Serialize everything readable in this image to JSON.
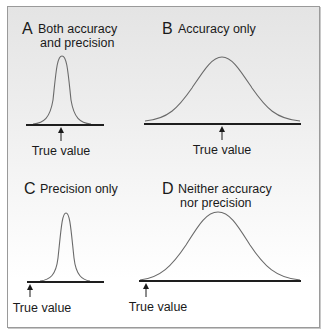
{
  "figure": {
    "panels": [
      {
        "letter": "A",
        "title_line1": "Both accuracy",
        "title_line2": "and precision",
        "true_value_label": "True value",
        "distribution": "narrow, centered on true value"
      },
      {
        "letter": "B",
        "title_line1": "Accuracy only",
        "title_line2": "",
        "true_value_label": "True value",
        "distribution": "wide, centered on true value"
      },
      {
        "letter": "C",
        "title_line1": "Precision only",
        "title_line2": "",
        "true_value_label": "True value",
        "distribution": "narrow, offset from true value"
      },
      {
        "letter": "D",
        "title_line1": "Neither accuracy",
        "title_line2": "nor precision",
        "true_value_label": "True value",
        "distribution": "wide, offset from true value"
      }
    ],
    "colors": {
      "curve": "#6a6a6a",
      "axis": "#1e1e1e",
      "text": "#1a1a1a",
      "border": "#9a9a9a"
    }
  }
}
